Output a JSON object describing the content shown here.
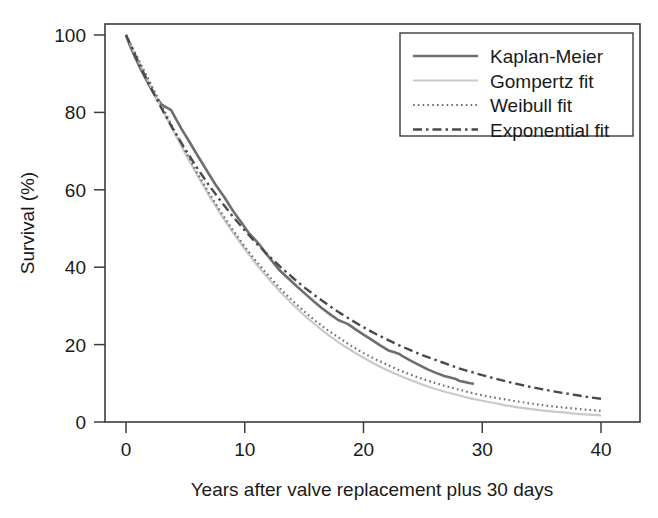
{
  "figure": {
    "background_color": "#ffffff",
    "frame_color": "#3c3c3c"
  },
  "chart_data": {
    "type": "line",
    "title": "",
    "xlabel": "Years after valve replacement plus 30 days",
    "ylabel": "Survival (%)",
    "xlim": [
      0,
      40
    ],
    "ylim": [
      0,
      100
    ],
    "xticks": [
      0,
      10,
      20,
      30,
      40
    ],
    "yticks": [
      0,
      20,
      40,
      60,
      80,
      100
    ],
    "xtick_labels": [
      "0",
      "10",
      "20",
      "30",
      "40"
    ],
    "ytick_labels": [
      "0",
      "20",
      "40",
      "60",
      "80",
      "100"
    ],
    "grid": false,
    "legend_position": "top-right",
    "series": [
      {
        "name": "Kaplan-Meier",
        "style": "solid",
        "color": "#6e6e6e",
        "width": 2.6,
        "dash": "",
        "x": [
          0,
          0.3,
          0.8,
          1.3,
          1.9,
          2.5,
          3.0,
          3.4,
          3.8,
          4.2,
          4.7,
          5.3,
          6.0,
          6.8,
          7.5,
          8.3,
          9.0,
          9.7,
          10.4,
          10.9,
          11.3,
          11.8,
          12.4,
          13.0,
          13.7,
          14.4,
          15.1,
          15.8,
          16.5,
          17.2,
          17.9,
          18.3,
          18.7,
          19.3,
          20.0,
          20.7,
          21.4,
          22.1,
          22.6,
          23.0,
          23.4,
          24.0,
          24.7,
          25.4,
          26.1,
          26.8,
          27.3,
          27.7,
          28.1,
          28.6,
          29.0,
          29.3
        ],
        "y": [
          100,
          97.5,
          94.0,
          90.8,
          87.3,
          84.0,
          82.0,
          81.3,
          80.6,
          78.3,
          75.6,
          72.6,
          69.0,
          65.0,
          61.5,
          58.0,
          54.6,
          51.6,
          48.6,
          47.0,
          45.6,
          43.5,
          41.2,
          39.0,
          37.0,
          35.0,
          33.1,
          31.2,
          29.4,
          27.8,
          26.3,
          25.8,
          25.3,
          24.0,
          22.6,
          21.2,
          19.8,
          18.5,
          18.0,
          17.6,
          16.8,
          15.8,
          14.7,
          13.6,
          12.7,
          11.9,
          11.5,
          11.2,
          10.6,
          10.3,
          10.0,
          9.9
        ]
      },
      {
        "name": "Gompertz fit",
        "style": "solid-light",
        "color": "#c9c9c9",
        "width": 2.2,
        "dash": "",
        "x": [
          0,
          1,
          2,
          3,
          4,
          5,
          6,
          7,
          8,
          9,
          10,
          11,
          12,
          13,
          14,
          15,
          16,
          17,
          18,
          19,
          20,
          21,
          22,
          23,
          24,
          25,
          26,
          27,
          28,
          29,
          30,
          31,
          32,
          33,
          34,
          35,
          36,
          37,
          38,
          39,
          40
        ],
        "y": [
          100,
          93.6,
          87.3,
          81.1,
          75.1,
          69.3,
          63.8,
          58.5,
          53.6,
          49.0,
          44.7,
          40.7,
          37.0,
          33.6,
          30.5,
          27.6,
          25.0,
          22.6,
          20.4,
          18.4,
          16.6,
          14.9,
          13.4,
          12.0,
          10.8,
          9.6,
          8.6,
          7.7,
          6.9,
          6.1,
          5.5,
          4.9,
          4.3,
          3.8,
          3.4,
          3.0,
          2.7,
          2.4,
          2.1,
          1.9,
          1.7
        ]
      },
      {
        "name": "Weibull fit",
        "style": "dotted",
        "color": "#6e6e6e",
        "width": 2.2,
        "dash": "1.6 3.2",
        "x": [
          0,
          1,
          2,
          3,
          4,
          5,
          6,
          7,
          8,
          9,
          10,
          11,
          12,
          13,
          14,
          15,
          16,
          17,
          18,
          19,
          20,
          21,
          22,
          23,
          24,
          25,
          26,
          27,
          28,
          29,
          30,
          31,
          32,
          33,
          34,
          35,
          36,
          37,
          38,
          39,
          40
        ],
        "y": [
          100,
          94.0,
          87.9,
          81.8,
          75.8,
          70.0,
          64.4,
          59.1,
          54.2,
          49.6,
          45.3,
          41.4,
          37.8,
          34.4,
          31.4,
          28.6,
          26.0,
          23.7,
          21.6,
          19.6,
          17.8,
          16.2,
          14.8,
          13.4,
          12.2,
          11.1,
          10.1,
          9.2,
          8.4,
          7.6,
          6.9,
          6.3,
          5.8,
          5.3,
          4.8,
          4.4,
          4.0,
          3.7,
          3.4,
          3.1,
          2.9
        ]
      },
      {
        "name": "Exponential fit",
        "style": "dash-dot",
        "color": "#4a4a4a",
        "width": 2.4,
        "dash": "9 4 2.5 4",
        "x": [
          0,
          1,
          2,
          3,
          4,
          5,
          6,
          7,
          8,
          9,
          10,
          11,
          12,
          13,
          14,
          15,
          16,
          17,
          18,
          19,
          20,
          21,
          22,
          23,
          24,
          25,
          26,
          27,
          28,
          29,
          30,
          31,
          32,
          33,
          34,
          35,
          36,
          37,
          38,
          39,
          40
        ],
        "y": [
          100,
          93.2,
          86.9,
          81.0,
          75.5,
          70.4,
          65.6,
          61.1,
          57.0,
          53.1,
          49.5,
          46.1,
          43.0,
          40.1,
          37.4,
          34.8,
          32.5,
          30.3,
          28.2,
          26.3,
          24.5,
          22.8,
          21.3,
          19.8,
          18.5,
          17.2,
          16.1,
          15.0,
          13.9,
          13.0,
          12.1,
          11.3,
          10.5,
          9.8,
          9.1,
          8.5,
          7.9,
          7.4,
          6.9,
          6.4,
          6.0
        ]
      }
    ]
  },
  "legend": {
    "entries": [
      {
        "label": "Kaplan-Meier"
      },
      {
        "label": "Gompertz fit"
      },
      {
        "label": "Weibull fit"
      },
      {
        "label": "Exponential fit"
      }
    ]
  }
}
